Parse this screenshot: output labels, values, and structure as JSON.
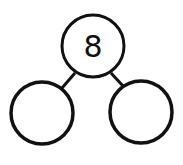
{
  "diagram": {
    "type": "number-bond",
    "whole": {
      "value": "8",
      "cx": 93,
      "cy": 46,
      "r": 31
    },
    "parts": [
      {
        "value": "",
        "cx": 42,
        "cy": 113,
        "r": 31
      },
      {
        "value": "",
        "cx": 141,
        "cy": 112,
        "r": 31
      }
    ],
    "colors": {
      "stroke": "#111111",
      "fill": "#ffffff"
    }
  }
}
